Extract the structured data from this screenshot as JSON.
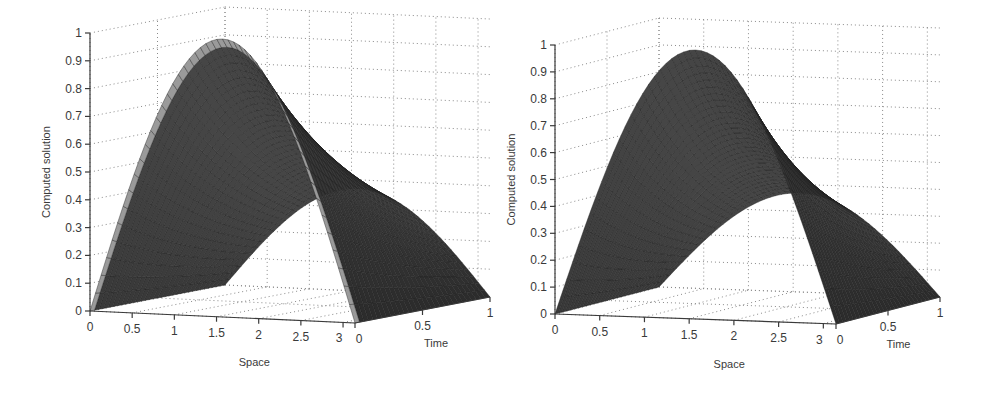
{
  "figure": {
    "background": "#ffffff",
    "ink_color": "#3a3a3a",
    "grid_color": "#8a8a8a",
    "surface_dark": "#3c3c3c",
    "surface_light": "#9a9a9a",
    "mesh_color": "#1e1e1e"
  },
  "chart_data": [
    {
      "type": "surface3d",
      "panel": "left",
      "title": "",
      "xlabel": "Space",
      "ylabel": "Time",
      "zlabel": "Computed solution",
      "xlim": [
        0,
        3.14159
      ],
      "ylim": [
        0,
        1
      ],
      "zlim": [
        0,
        1
      ],
      "x_ticks": [
        "0",
        "0.5",
        "1",
        "1.5",
        "2",
        "2.5",
        "3"
      ],
      "y_ticks": [
        "0",
        "0.5",
        "1"
      ],
      "z_ticks": [
        "0",
        "0.1",
        "0.2",
        "0.3",
        "0.4",
        "0.5",
        "0.6",
        "0.7",
        "0.8",
        "0.9",
        "1"
      ],
      "grid": true,
      "description": "Surface u(x,t) = exp(-t)*sin(x); initial profile sin(x) peaks at 1.0 at x=pi/2, t=0, decays to about 0.37 at t=1",
      "function": "exp(-t)*sin(x)",
      "series": [
        {
          "name": "t=0",
          "x": [
            0,
            0.5,
            1.0,
            1.5708,
            2.0,
            2.5,
            3.1416
          ],
          "z": [
            0,
            0.479,
            0.841,
            1.0,
            0.909,
            0.598,
            0
          ]
        },
        {
          "name": "t=0.5",
          "x": [
            0,
            0.5,
            1.0,
            1.5708,
            2.0,
            2.5,
            3.1416
          ],
          "z": [
            0,
            0.291,
            0.51,
            0.607,
            0.552,
            0.363,
            0
          ]
        },
        {
          "name": "t=1",
          "x": [
            0,
            0.5,
            1.0,
            1.5708,
            2.0,
            2.5,
            3.1416
          ],
          "z": [
            0,
            0.176,
            0.309,
            0.368,
            0.334,
            0.22,
            0
          ]
        }
      ],
      "geometry": {
        "origin": [
          90,
          311
        ],
        "x_end": [
          355,
          323
        ],
        "y_end": [
          490,
          297
        ],
        "z_top": [
          90,
          33
        ]
      },
      "style": "front slab light-striped, rest dark mesh"
    },
    {
      "type": "surface3d",
      "panel": "right",
      "title": "",
      "xlabel": "Space",
      "ylabel": "Time",
      "zlabel": "Computed solution",
      "xlim": [
        0,
        3.14159
      ],
      "ylim": [
        0,
        1
      ],
      "zlim": [
        0,
        1
      ],
      "x_ticks": [
        "0",
        "0.5",
        "1",
        "1.5",
        "2",
        "2.5",
        "3"
      ],
      "y_ticks": [
        "0",
        "0.5",
        "1"
      ],
      "z_ticks": [
        "0",
        "0.1",
        "0.2",
        "0.3",
        "0.4",
        "0.5",
        "0.6",
        "0.7",
        "0.8",
        "0.9",
        "1"
      ],
      "grid": true,
      "description": "Surface u(x,t) with smooth initial profile sin(x) peaking at 1.0, decaying to about 0.37 at t=1",
      "function": "exp(-t)*sin(x)",
      "series": [
        {
          "name": "t=0",
          "x": [
            0,
            0.5,
            1.0,
            1.5708,
            2.0,
            2.5,
            3.1416
          ],
          "z": [
            0,
            0.479,
            0.841,
            1.0,
            0.909,
            0.598,
            0
          ]
        },
        {
          "name": "t=0.5",
          "x": [
            0,
            0.5,
            1.0,
            1.5708,
            2.0,
            2.5,
            3.1416
          ],
          "z": [
            0,
            0.291,
            0.51,
            0.607,
            0.552,
            0.363,
            0
          ]
        },
        {
          "name": "t=1",
          "x": [
            0,
            0.5,
            1.0,
            1.5708,
            2.0,
            2.5,
            3.1416
          ],
          "z": [
            0,
            0.176,
            0.309,
            0.368,
            0.334,
            0.22,
            0
          ]
        }
      ],
      "geometry": {
        "origin": [
          555,
          314
        ],
        "x_end": [
          836,
          324
        ],
        "y_end": [
          940,
          297
        ],
        "z_top": [
          555,
          45
        ]
      },
      "style": "uniform dark mesh"
    }
  ]
}
